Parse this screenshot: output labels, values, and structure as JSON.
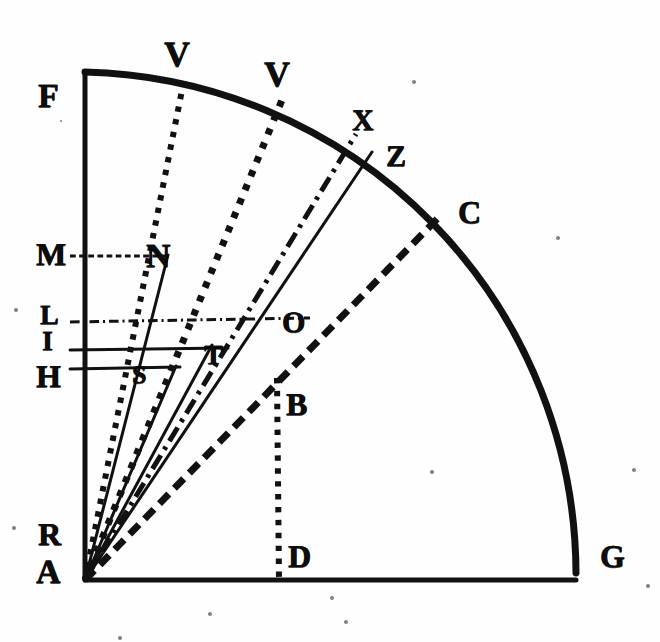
{
  "figure": {
    "kind": "geometric-construction",
    "ink_color": "#111111",
    "paper_color": "#fefefe",
    "width": 660,
    "height": 642
  },
  "labels": [
    {
      "id": "F",
      "text": "F",
      "x": 38,
      "y": 80,
      "size": 34
    },
    {
      "id": "V1",
      "text": "V",
      "x": 164,
      "y": 36,
      "size": 36
    },
    {
      "id": "V2",
      "text": "V",
      "x": 264,
      "y": 56,
      "size": 36
    },
    {
      "id": "X",
      "text": "X",
      "x": 352,
      "y": 106,
      "size": 30
    },
    {
      "id": "Z",
      "text": "Z",
      "x": 386,
      "y": 142,
      "size": 30
    },
    {
      "id": "C",
      "text": "C",
      "x": 458,
      "y": 196,
      "size": 32
    },
    {
      "id": "M",
      "text": "M",
      "x": 36,
      "y": 238,
      "size": 32
    },
    {
      "id": "N",
      "text": "N",
      "x": 146,
      "y": 240,
      "size": 34
    },
    {
      "id": "L",
      "text": "L",
      "x": 40,
      "y": 302,
      "size": 28
    },
    {
      "id": "I",
      "text": "I",
      "x": 42,
      "y": 328,
      "size": 28
    },
    {
      "id": "O",
      "text": "O",
      "x": 282,
      "y": 308,
      "size": 30
    },
    {
      "id": "T",
      "text": "T",
      "x": 204,
      "y": 342,
      "size": 28
    },
    {
      "id": "H",
      "text": "H",
      "x": 36,
      "y": 360,
      "size": 32
    },
    {
      "id": "S",
      "text": "S",
      "x": 132,
      "y": 362,
      "size": 26
    },
    {
      "id": "B",
      "text": "B",
      "x": 286,
      "y": 388,
      "size": 32
    },
    {
      "id": "R",
      "text": "R",
      "x": 38,
      "y": 518,
      "size": 32
    },
    {
      "id": "A",
      "text": "A",
      "x": 36,
      "y": 556,
      "size": 34
    },
    {
      "id": "D",
      "text": "D",
      "x": 288,
      "y": 540,
      "size": 32
    },
    {
      "id": "G",
      "text": "G",
      "x": 600,
      "y": 540,
      "size": 32
    }
  ],
  "geometry": {
    "vertex": {
      "name": "A",
      "x": 85,
      "y": 580
    },
    "arc": {
      "name": "arc-FCG",
      "from": {
        "name": "F",
        "x": 85,
        "y": 72
      },
      "to": {
        "name": "G",
        "x": 576,
        "y": 573
      },
      "radius": 503,
      "stroke_width": 7
    },
    "axis_vertical": {
      "name": "AF",
      "x1": 85,
      "y1": 580,
      "x2": 85,
      "y2": 72,
      "stroke_width": 5
    },
    "axis_horizontal": {
      "name": "AG",
      "x1": 85,
      "y1": 580,
      "x2": 576,
      "y2": 580,
      "stroke_width": 5
    },
    "rays": [
      {
        "name": "ray-A-V1",
        "style": "dotted",
        "x2": 184,
        "y2": 80,
        "width": 6
      },
      {
        "name": "ray-A-V2",
        "style": "dotted",
        "x2": 282,
        "y2": 100,
        "width": 7
      },
      {
        "name": "ray-A-X",
        "style": "dashdot",
        "x2": 356,
        "y2": 134,
        "width": 5
      },
      {
        "name": "ray-A-Z",
        "style": "solid",
        "x2": 372,
        "y2": 152,
        "width": 3
      },
      {
        "name": "ray-A-C",
        "style": "dashed",
        "x2": 438,
        "y2": 218,
        "width": 7
      },
      {
        "name": "ray-A-N",
        "style": "solid",
        "x2": 168,
        "y2": 255,
        "width": 3
      },
      {
        "name": "ray-A-T",
        "style": "solid",
        "x2": 212,
        "y2": 345,
        "width": 3
      },
      {
        "name": "ray-A-S",
        "style": "solid",
        "x2": 176,
        "y2": 366,
        "width": 3
      }
    ],
    "horizontals": [
      {
        "name": "line-M-N",
        "style": "dashed",
        "x1": 70,
        "y1": 256,
        "x2": 170,
        "y2": 256,
        "width": 3
      },
      {
        "name": "line-L-O",
        "style": "dashdot",
        "x1": 70,
        "y1": 322,
        "x2": 310,
        "y2": 318,
        "width": 3
      },
      {
        "name": "line-I-T",
        "style": "solid",
        "x1": 70,
        "y1": 350,
        "x2": 228,
        "y2": 348,
        "width": 3
      },
      {
        "name": "line-H-S",
        "style": "solid",
        "x1": 70,
        "y1": 369,
        "x2": 180,
        "y2": 367,
        "width": 3
      }
    ],
    "verticals": [
      {
        "name": "line-B-D",
        "style": "dotted",
        "x1": 277,
        "y1": 378,
        "x2": 279,
        "y2": 580,
        "width": 6
      }
    ]
  },
  "specks": [
    {
      "x": 12,
      "y": 526,
      "r": 2
    },
    {
      "x": 14,
      "y": 308,
      "r": 2
    },
    {
      "x": 632,
      "y": 468,
      "r": 2
    },
    {
      "x": 646,
      "y": 584,
      "r": 2
    },
    {
      "x": 60,
      "y": 120,
      "r": 1
    },
    {
      "x": 430,
      "y": 470,
      "r": 2
    },
    {
      "x": 208,
      "y": 612,
      "r": 2
    },
    {
      "x": 344,
      "y": 620,
      "r": 2
    },
    {
      "x": 118,
      "y": 636,
      "r": 2
    },
    {
      "x": 556,
      "y": 236,
      "r": 2
    },
    {
      "x": 412,
      "y": 80,
      "r": 2
    },
    {
      "x": 330,
      "y": 596,
      "r": 2
    }
  ]
}
